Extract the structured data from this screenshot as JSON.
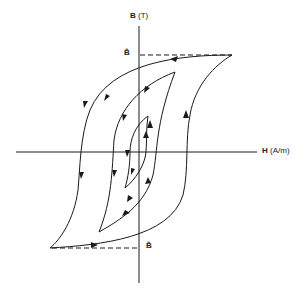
{
  "diagram": {
    "type": "hysteresis-loops",
    "axes": {
      "y_label_symbol": "B",
      "y_label_unit": "(T)",
      "x_label_symbol": "H",
      "x_label_unit": "(A/m)"
    },
    "markers": {
      "b_hat_top": "B̂",
      "b_hat_bottom": "B̂"
    },
    "loops": [
      {
        "name": "outer",
        "tip_top": [
          232,
          53
        ],
        "tip_bottom": [
          50,
          248
        ]
      },
      {
        "name": "middle",
        "tip_top": [
          175,
          72
        ],
        "tip_bottom": [
          99,
          232
        ]
      },
      {
        "name": "inner",
        "tip_top": [
          148,
          116
        ],
        "tip_bottom": [
          125,
          188
        ]
      }
    ],
    "colors": {
      "stroke": "#1a1a1a",
      "background": "#ffffff"
    }
  }
}
